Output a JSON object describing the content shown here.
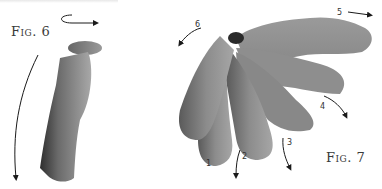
{
  "figures": [
    {
      "id": "fig6",
      "label": "Fig. 6",
      "description": "Single curled grey tube with rotation arrows"
    },
    {
      "id": "fig7",
      "label": "Fig. 7",
      "description": "Fan of six grey tubes radiating from a common pivot",
      "step_numbers": [
        "1",
        "2",
        "3",
        "4",
        "5",
        "6"
      ]
    }
  ],
  "colors": {
    "tube_dark": "#3c3c3c",
    "tube_mid": "#8a8a8a",
    "tube_light": "#b4b4b4",
    "arrow": "#1a1a1a",
    "text": "#3a3a3a"
  }
}
